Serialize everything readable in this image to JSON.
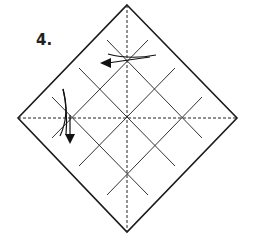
{
  "step_label": "4.",
  "colors": {
    "line": "#1a1a1a",
    "grid": "#333333",
    "background": "#ffffff"
  },
  "diagram": {
    "shape": "square-rotated-45",
    "vertices": {
      "top": [
        127,
        5
      ],
      "right": [
        237,
        118
      ],
      "bottom": [
        127,
        232
      ],
      "left": [
        18,
        118
      ]
    },
    "center": [
      127,
      118
    ],
    "fold_lines": {
      "vertical_dashed": true,
      "horizontal_dashed": true
    },
    "grid": "4x4 diagonal crease grid",
    "arrows": [
      {
        "name": "fold-arrow-top",
        "direction": "left",
        "position": [
          102,
          62
        ]
      },
      {
        "name": "fold-arrow-left",
        "direction": "down",
        "position": [
          70,
          140
        ]
      }
    ]
  }
}
